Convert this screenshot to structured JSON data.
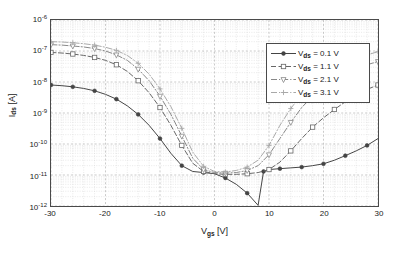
{
  "chart_data": {
    "type": "line",
    "title": "",
    "xlabel": "V_gs [V]",
    "ylabel": "I_ds [A]",
    "xlabel_base": "V",
    "xlabel_sub": "gs",
    "xlabel_unit": "[V]",
    "ylabel_base": "I",
    "ylabel_sub": "ds",
    "ylabel_unit": "[A]",
    "xscale": "linear",
    "yscale": "log",
    "xlim": [
      -30,
      30
    ],
    "ylim": [
      1e-12,
      1e-06
    ],
    "grid": "major and minor log grid on, dotted",
    "legend_position": "top-right inside axes",
    "xticks": [
      -30,
      -20,
      -10,
      0,
      10,
      20,
      30
    ],
    "xticklabels": [
      "-30",
      "-20",
      "-10",
      "0",
      "10",
      "20",
      "30"
    ],
    "yticks": [
      1e-06,
      1e-07,
      1e-08,
      1e-09,
      1e-10,
      1e-11,
      1e-12
    ],
    "yticklabels": [
      "10-6",
      "10-7",
      "10-8",
      "10-9",
      "10-10",
      "10-11",
      "10-12"
    ],
    "yticks_exponents": [
      "-6",
      "-7",
      "-8",
      "-9",
      "-10",
      "-11",
      "-12"
    ],
    "series": [
      {
        "name": "Vds = 0.1 V",
        "label_base": "V",
        "label_sub": "ds",
        "label_value": "= 0.1 V",
        "marker": "filled-circle",
        "linestyle": "solid",
        "color": "#444444",
        "x": [
          -30,
          -28,
          -26,
          -24,
          -22,
          -20,
          -18,
          -16,
          -14,
          -12,
          -10,
          -8,
          -6,
          -4,
          -2,
          0,
          2,
          4,
          6,
          8,
          9,
          10,
          12,
          14,
          16,
          18,
          20,
          22,
          24,
          26,
          28,
          30
        ],
        "y": [
          8e-09,
          7.6e-09,
          7e-09,
          6.2e-09,
          5.2e-09,
          4e-09,
          2.8e-09,
          1.7e-09,
          9e-10,
          4e-10,
          1.5e-10,
          5e-11,
          2e-11,
          1.3e-11,
          1.2e-11,
          1.1e-11,
          8e-12,
          5e-12,
          2.6e-12,
          1.05e-12,
          1.3e-11,
          1.5e-11,
          1.6e-11,
          1.7e-11,
          1.8e-11,
          2e-11,
          2.3e-11,
          3e-11,
          4.2e-11,
          6e-11,
          9e-11,
          1.5e-10
        ]
      },
      {
        "name": "Vds = 1.1 V",
        "label_base": "V",
        "label_sub": "ds",
        "label_value": "= 1.1 V",
        "marker": "open-square",
        "linestyle": "dashed",
        "color": "#666666",
        "x": [
          -30,
          -28,
          -26,
          -24,
          -22,
          -20,
          -18,
          -16,
          -14,
          -12,
          -10,
          -8,
          -6,
          -4,
          -2,
          0,
          2,
          4,
          6,
          8,
          10,
          12,
          14,
          16,
          18,
          20,
          22,
          24,
          26,
          28,
          30
        ],
        "y": [
          9e-08,
          8.6e-08,
          8e-08,
          7.2e-08,
          6.2e-08,
          5e-08,
          3.6e-08,
          2.2e-08,
          1.1e-08,
          4.5e-09,
          1.5e-09,
          4e-10,
          9e-11,
          2.4e-11,
          1.3e-11,
          1.1e-11,
          1.05e-11,
          1.05e-11,
          1.1e-11,
          1.2e-11,
          1.5e-11,
          2.6e-11,
          6e-11,
          1.5e-10,
          3.5e-10,
          7e-10,
          1.3e-09,
          2.3e-09,
          3.8e-09,
          5.8e-09,
          8e-09
        ]
      },
      {
        "name": "Vds = 2.1 V",
        "label_base": "V",
        "label_sub": "ds",
        "label_value": "= 2.1 V",
        "marker": "open-triangle-down",
        "linestyle": "dash-dot",
        "color": "#888888",
        "x": [
          -30,
          -28,
          -26,
          -24,
          -22,
          -20,
          -18,
          -16,
          -14,
          -12,
          -10,
          -8,
          -6,
          -4,
          -2,
          0,
          2,
          4,
          6,
          8,
          10,
          12,
          14,
          16,
          18,
          20,
          22,
          24,
          26,
          28,
          30
        ],
        "y": [
          1.6e-07,
          1.55e-07,
          1.45e-07,
          1.35e-07,
          1.2e-07,
          1e-07,
          7.5e-08,
          5e-08,
          2.6e-08,
          1.1e-08,
          3.5e-09,
          9e-10,
          1.8e-10,
          3.5e-11,
          1.5e-11,
          1.2e-11,
          1.15e-11,
          1.2e-11,
          1.4e-11,
          2e-11,
          4.5e-11,
          1.5e-10,
          5e-10,
          1.5e-09,
          3.5e-09,
          7e-09,
          1.2e-08,
          1.9e-08,
          2.7e-08,
          3.6e-08,
          4.6e-08
        ]
      },
      {
        "name": "Vds = 3.1 V",
        "label_base": "V",
        "label_sub": "ds",
        "label_value": "= 3.1 V",
        "marker": "plus",
        "linestyle": "dash-dot-light",
        "color": "#a8a8a8",
        "x": [
          -30,
          -28,
          -26,
          -24,
          -22,
          -20,
          -18,
          -16,
          -14,
          -12,
          -10,
          -8,
          -6,
          -4,
          -2,
          0,
          2,
          4,
          6,
          8,
          10,
          12,
          14,
          16,
          18,
          20,
          22,
          24,
          26,
          28,
          30
        ],
        "y": [
          2e-07,
          1.95e-07,
          1.85e-07,
          1.72e-07,
          1.55e-07,
          1.32e-07,
          1.05e-07,
          7.2e-08,
          4e-08,
          1.8e-08,
          6e-09,
          1.6e-09,
          3.2e-10,
          5.5e-11,
          1.9e-11,
          1.3e-11,
          1.25e-11,
          1.4e-11,
          1.8e-11,
          3e-11,
          9e-11,
          4e-10,
          1.4e-09,
          4e-09,
          9e-09,
          1.7e-08,
          2.8e-08,
          4.2e-08,
          5.8e-08,
          7.5e-08,
          9.5e-08
        ]
      }
    ]
  },
  "legend": {
    "entries": [
      {
        "label_base": "V",
        "label_sub": "ds",
        "label_value": "= 0.1 V"
      },
      {
        "label_base": "V",
        "label_sub": "ds",
        "label_value": "= 1.1 V"
      },
      {
        "label_base": "V",
        "label_sub": "ds",
        "label_value": "= 2.1 V"
      },
      {
        "label_base": "V",
        "label_sub": "ds",
        "label_value": "= 3.1 V"
      }
    ]
  },
  "style": {
    "axis_color": "#4a4a4a",
    "grid_major_color": "#b4b4b4",
    "grid_minor_color": "#d2d2d2",
    "background": "#ffffff"
  }
}
